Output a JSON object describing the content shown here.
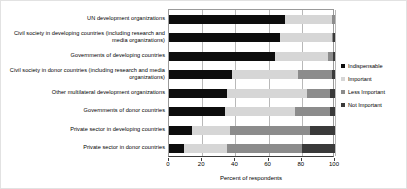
{
  "chart_data": {
    "type": "bar",
    "orientation": "horizontal",
    "stacked": true,
    "stack_mode": "percent",
    "title": "",
    "subtitle": "",
    "xlabel": "Percent of respondents",
    "ylabel": "",
    "xlim": [
      0,
      100
    ],
    "xticks": [
      0,
      20,
      40,
      60,
      80,
      100
    ],
    "xtick_labels": [
      "0",
      "20",
      "40",
      "60",
      "80",
      "100"
    ],
    "grid": true,
    "grid_axis": "x",
    "legend_position": "right",
    "categories": [
      "UN development organizations",
      "Civil society in developing countries (including research and media organizations)",
      "Governments of developing countries",
      "Civil society in donor countries (including research and media organizations)",
      "Other multilateral development organizations",
      "Governments of donor countries",
      "Private sector in developing countries",
      "Private sector in donor countries"
    ],
    "series": [
      {
        "name": "Indispensable",
        "color": "#0d0d0d",
        "values": [
          70,
          67,
          64,
          38,
          35,
          34,
          14,
          9
        ]
      },
      {
        "name": "Important",
        "color": "#d6d6d6",
        "values": [
          28,
          31,
          32,
          40,
          48,
          42,
          23,
          26
        ]
      },
      {
        "name": "Less Important",
        "color": "#8c8c8c",
        "values": [
          2,
          1,
          3,
          20,
          14,
          21,
          48,
          45
        ]
      },
      {
        "name": "Not Important",
        "color": "#3a3a3a",
        "values": [
          0,
          1,
          1,
          2,
          3,
          3,
          15,
          20
        ]
      }
    ]
  },
  "legend": {
    "items": [
      {
        "label": "Indispensable",
        "color": "#0d0d0d"
      },
      {
        "label": "Important",
        "color": "#d6d6d6"
      },
      {
        "label": "Less Important",
        "color": "#8c8c8c"
      },
      {
        "label": "Not Important",
        "color": "#3a3a3a"
      }
    ]
  },
  "axis": {
    "x_title": "Percent of respondents",
    "tick_labels": [
      "0",
      "20",
      "40",
      "60",
      "80",
      "100"
    ]
  }
}
